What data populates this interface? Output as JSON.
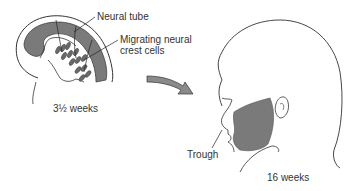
{
  "diagram": {
    "type": "anatomical-illustration",
    "stages": [
      {
        "id": "embryo",
        "caption": "3½  weeks",
        "labels": {
          "neural_tube": "Neural tube",
          "neural_crest_line1": "Migrating neural",
          "neural_crest_line2": "crest cells"
        }
      },
      {
        "id": "fetus",
        "caption": "16 weeks",
        "labels": {
          "trough": "Trough"
        }
      }
    ],
    "colors": {
      "shading": "#7a7a7a",
      "outline": "#333333",
      "arrow_fill": "#8a8a8a",
      "background": "#ffffff"
    }
  }
}
